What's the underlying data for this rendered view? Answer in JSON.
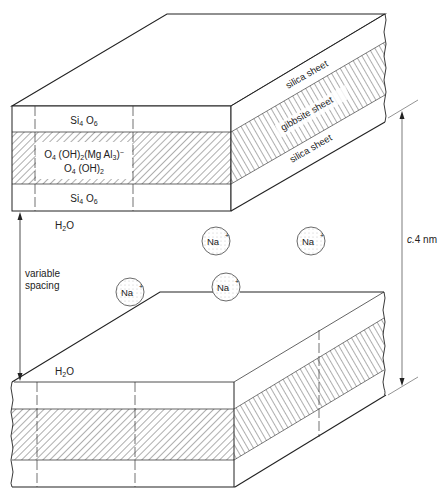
{
  "top_block": {
    "front_labels": {
      "upper_silica": "Si4O6",
      "gibbsite_line1": "O4 (OH)2 (Mg Al3)−",
      "gibbsite_line2": "O4 (OH)2",
      "lower_silica": "Si4O6"
    },
    "side_labels": {
      "upper": "silica sheet",
      "middle": "gibbsite sheet",
      "lower": "silica sheet"
    }
  },
  "interlayer": {
    "water_top": "H2O",
    "water_bottom": "H2O",
    "ions": [
      "Na+",
      "Na+",
      "Na+",
      "Na+"
    ],
    "variable_spacing_line1": "variable",
    "variable_spacing_line2": "spacing"
  },
  "dimension": {
    "label_italic": "c.",
    "label_value": "4 nm"
  }
}
